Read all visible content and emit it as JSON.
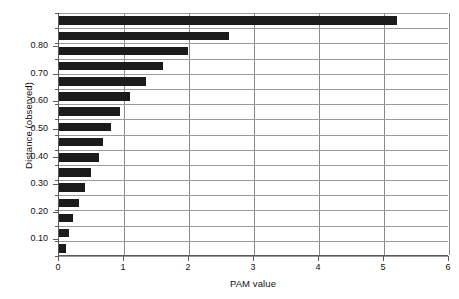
{
  "chart_data": {
    "type": "bar",
    "orientation": "horizontal",
    "title": "",
    "xlabel": "PAM value",
    "ylabel": "Distance (observed)",
    "xlim": [
      0,
      6
    ],
    "ylim": [
      0.04,
      0.92
    ],
    "xticks": [
      0,
      1,
      2,
      3,
      4,
      5,
      6
    ],
    "xtick_labels": [
      "0",
      "1",
      "2",
      "3",
      "4",
      "5",
      "6"
    ],
    "yticks": [
      0.1,
      0.2,
      0.3,
      0.4,
      0.5,
      0.6,
      0.7,
      0.8
    ],
    "ytick_labels": [
      "0.10",
      "0.20",
      "0.30",
      "0.40",
      "0.50",
      "0.60",
      "0.70",
      "0.80"
    ],
    "grid": "vertical-and-horizontal",
    "legend": "none",
    "bar_color": "#1b1b1b",
    "categories": [
      0.875,
      0.825,
      0.775,
      0.725,
      0.675,
      0.625,
      0.575,
      0.525,
      0.475,
      0.425,
      0.375,
      0.325,
      0.275,
      0.225,
      0.175,
      0.125
    ],
    "values": [
      5.2,
      2.62,
      1.98,
      1.6,
      1.34,
      1.09,
      0.94,
      0.8,
      0.67,
      0.61,
      0.49,
      0.4,
      0.3,
      0.22,
      0.15,
      0.1
    ]
  }
}
